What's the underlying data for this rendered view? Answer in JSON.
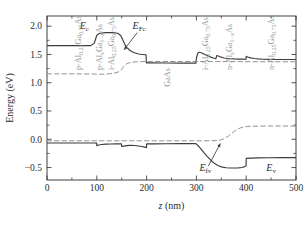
{
  "chart_data": {
    "type": "line",
    "title": "",
    "xlabel": "z (nm)",
    "ylabel": "Energy (eV)",
    "xlim": [
      0,
      500
    ],
    "ylim": [
      -0.72,
      2.18
    ],
    "xticks": [
      0,
      100,
      200,
      300,
      400,
      500
    ],
    "xticklabels": [
      "0",
      "100",
      "200",
      "300",
      "400",
      "500"
    ],
    "yticks": [
      -0.5,
      0.0,
      0.5,
      1.0,
      1.5,
      2.0
    ],
    "yticklabels": [
      "−0.5",
      "0.0",
      "0.5",
      "1.0",
      "1.5",
      "2.0"
    ],
    "grid": false,
    "legend": "none",
    "series": [
      {
        "name": "E_c",
        "style": "solid",
        "color": "#3d3d3d",
        "points": [
          [
            0,
            1.655
          ],
          [
            60,
            1.655
          ],
          [
            88,
            1.656
          ],
          [
            95,
            1.7
          ],
          [
            100,
            1.84
          ],
          [
            106,
            1.875
          ],
          [
            118,
            1.885
          ],
          [
            132,
            1.885
          ],
          [
            142,
            1.875
          ],
          [
            148,
            1.835
          ],
          [
            152,
            1.76
          ],
          [
            156,
            1.685
          ],
          [
            160,
            1.625
          ],
          [
            166,
            1.575
          ],
          [
            174,
            1.535
          ],
          [
            184,
            1.508
          ],
          [
            196,
            1.495
          ],
          [
            199,
            1.492
          ],
          [
            199.5,
            1.352
          ],
          [
            210,
            1.35
          ],
          [
            240,
            1.348
          ],
          [
            270,
            1.347
          ],
          [
            296,
            1.346
          ],
          [
            299,
            1.345
          ],
          [
            299.5,
            1.4
          ],
          [
            301,
            1.47
          ],
          [
            303,
            1.525
          ],
          [
            306,
            1.538
          ],
          [
            311,
            1.525
          ],
          [
            318,
            1.495
          ],
          [
            326,
            1.462
          ],
          [
            334,
            1.437
          ],
          [
            339,
            1.424
          ],
          [
            341,
            1.481
          ],
          [
            344,
            1.472
          ],
          [
            350,
            1.452
          ],
          [
            356,
            1.438
          ],
          [
            362,
            1.429
          ],
          [
            368,
            1.424
          ],
          [
            374,
            1.421
          ],
          [
            379,
            1.419
          ],
          [
            384,
            1.418
          ],
          [
            389,
            1.417
          ],
          [
            394,
            1.417
          ],
          [
            398,
            1.416
          ],
          [
            399.5,
            1.414
          ],
          [
            400,
            1.468
          ],
          [
            403,
            1.456
          ],
          [
            409,
            1.44
          ],
          [
            416,
            1.428
          ],
          [
            424,
            1.421
          ],
          [
            434,
            1.416
          ],
          [
            446,
            1.413
          ],
          [
            460,
            1.411
          ],
          [
            476,
            1.41
          ],
          [
            500,
            1.41
          ]
        ]
      },
      {
        "name": "E_v",
        "style": "solid",
        "color": "#3d3d3d",
        "points": [
          [
            0,
            -0.065
          ],
          [
            40,
            -0.065
          ],
          [
            80,
            -0.065
          ],
          [
            95,
            -0.066
          ],
          [
            99,
            -0.068
          ],
          [
            99.8,
            -0.068
          ],
          [
            100,
            -0.112
          ],
          [
            104,
            -0.102
          ],
          [
            110,
            -0.092
          ],
          [
            118,
            -0.086
          ],
          [
            128,
            -0.083
          ],
          [
            138,
            -0.082
          ],
          [
            147,
            -0.082
          ],
          [
            149.5,
            -0.082
          ],
          [
            150,
            -0.128
          ],
          [
            154,
            -0.12
          ],
          [
            160,
            -0.112
          ],
          [
            167,
            -0.108
          ],
          [
            176,
            -0.11
          ],
          [
            184,
            -0.118
          ],
          [
            191,
            -0.128
          ],
          [
            196,
            -0.138
          ],
          [
            199,
            -0.146
          ],
          [
            199.8,
            -0.148
          ],
          [
            200,
            -0.082
          ],
          [
            215,
            -0.08
          ],
          [
            240,
            -0.079
          ],
          [
            270,
            -0.078
          ],
          [
            296,
            -0.078
          ],
          [
            299,
            -0.078
          ],
          [
            300,
            -0.085
          ],
          [
            304,
            -0.118
          ],
          [
            309,
            -0.17
          ],
          [
            315,
            -0.235
          ],
          [
            322,
            -0.305
          ],
          [
            329,
            -0.37
          ],
          [
            336,
            -0.425
          ],
          [
            344,
            -0.468
          ],
          [
            352,
            -0.492
          ],
          [
            360,
            -0.503
          ],
          [
            368,
            -0.507
          ],
          [
            376,
            -0.507
          ],
          [
            384,
            -0.505
          ],
          [
            391,
            -0.498
          ],
          [
            396,
            -0.487
          ],
          [
            399,
            -0.473
          ],
          [
            399.8,
            -0.468
          ],
          [
            400,
            -0.338
          ],
          [
            410,
            -0.332
          ],
          [
            425,
            -0.328
          ],
          [
            445,
            -0.326
          ],
          [
            470,
            -0.325
          ],
          [
            500,
            -0.325
          ]
        ]
      },
      {
        "name": "E_Fc",
        "style": "dashed",
        "color": "#8c8c8c",
        "points": [
          [
            0,
            1.158
          ],
          [
            30,
            1.157
          ],
          [
            60,
            1.156
          ],
          [
            85,
            1.155
          ],
          [
            95,
            1.153
          ],
          [
            105,
            1.15
          ],
          [
            115,
            1.152
          ],
          [
            125,
            1.158
          ],
          [
            135,
            1.17
          ],
          [
            142,
            1.185
          ],
          [
            148,
            1.215
          ],
          [
            152,
            1.262
          ],
          [
            156,
            1.305
          ],
          [
            160,
            1.334
          ],
          [
            165,
            1.352
          ],
          [
            172,
            1.364
          ],
          [
            180,
            1.37
          ],
          [
            190,
            1.373
          ],
          [
            200,
            1.374
          ],
          [
            230,
            1.375
          ],
          [
            270,
            1.375
          ],
          [
            300,
            1.375
          ],
          [
            330,
            1.375
          ],
          [
            360,
            1.374
          ],
          [
            390,
            1.373
          ],
          [
            420,
            1.372
          ],
          [
            460,
            1.371
          ],
          [
            500,
            1.371
          ]
        ]
      },
      {
        "name": "E_fv",
        "style": "dashed",
        "color": "#8c8c8c",
        "points": [
          [
            0,
            -0.027
          ],
          [
            40,
            -0.027
          ],
          [
            80,
            -0.027
          ],
          [
            120,
            -0.027
          ],
          [
            160,
            -0.027
          ],
          [
            200,
            -0.027
          ],
          [
            240,
            -0.027
          ],
          [
            280,
            -0.027
          ],
          [
            310,
            -0.027
          ],
          [
            330,
            -0.026
          ],
          [
            345,
            -0.02
          ],
          [
            352,
            -0.005
          ],
          [
            358,
            0.02
          ],
          [
            364,
            0.055
          ],
          [
            370,
            0.098
          ],
          [
            376,
            0.14
          ],
          [
            382,
            0.175
          ],
          [
            388,
            0.2
          ],
          [
            394,
            0.215
          ],
          [
            400,
            0.224
          ],
          [
            410,
            0.23
          ],
          [
            425,
            0.233
          ],
          [
            445,
            0.234
          ],
          [
            470,
            0.235
          ],
          [
            500,
            0.235
          ]
        ]
      }
    ],
    "annotations": [
      {
        "name": "Ec-label",
        "text": "E",
        "sub": "c",
        "x": 75,
        "y": 1.955,
        "kind": "curve-label"
      },
      {
        "name": "EFc-label",
        "text": "E",
        "sub": "Fc",
        "x": 185,
        "y": 1.955,
        "kind": "curve-label"
      },
      {
        "name": "Efv-label",
        "text": "E",
        "sub": "fv",
        "x": 318,
        "y": -0.565,
        "kind": "curve-label"
      },
      {
        "name": "Ev-label",
        "text": "E",
        "sub": "v",
        "x": 450,
        "y": -0.565,
        "kind": "curve-label"
      }
    ],
    "arrows": [
      {
        "name": "EFc-arrow",
        "from_x": 181,
        "from_y": 1.885,
        "to_x": 155,
        "to_y": 1.585
      },
      {
        "name": "Efv-arrow",
        "from_x": 324,
        "from_y": -0.475,
        "to_x": 348,
        "to_y": -0.075
      }
    ],
    "layer_labels": [
      {
        "name": "layer-p-AlGaAs-025",
        "text": "p-Al",
        "sub1": "0.25",
        "text2": "Ga",
        "sub2": "0.75",
        "text3": "As",
        "x": 68,
        "y_top": 1.225
      },
      {
        "name": "layer-p-AlGaAs-x",
        "text": "p-Al",
        "sub1": "x",
        "text2": "Ga",
        "sub2": "1−x",
        "text3": "As",
        "x": 110,
        "y_top": 1.225
      },
      {
        "name": "layer-i-AlGaAs-025",
        "text": "i-Al",
        "sub1": "0.25",
        "text2": "Ga",
        "sub2": "0.75",
        "text3": "As",
        "x": 135,
        "y_top": 1.225
      },
      {
        "name": "layer-GaAs",
        "text": "GaAs",
        "sub1": "",
        "text2": "",
        "sub2": "",
        "text3": "",
        "x": 247,
        "y_top": 0.93
      },
      {
        "name": "layer-i-AlGaAs-025-right",
        "text": "i-Al",
        "sub1": "0.25",
        "text2": "Ga",
        "sub2": "0.75",
        "text3": "As",
        "x": 323,
        "y_top": 1.225
      },
      {
        "name": "layer-n-AlGaAs-x",
        "text": "n-Al",
        "sub1": "x",
        "text2": "Ga",
        "sub2": "1−x",
        "text3": "As",
        "x": 372,
        "y_top": 1.225
      },
      {
        "name": "layer-n-AlGaAs-025",
        "text": "n-Al",
        "sub1": "0.25",
        "text2": "Ga",
        "sub2": "0.75",
        "text3": "As",
        "x": 455,
        "y_top": 1.225
      }
    ]
  },
  "colors": {
    "band_line": "#3d3d3d",
    "fermi_line": "#8c8c8c",
    "layer_text": "#9a9a9a",
    "axis": "#2b2b2b",
    "background": "#ffffff"
  }
}
